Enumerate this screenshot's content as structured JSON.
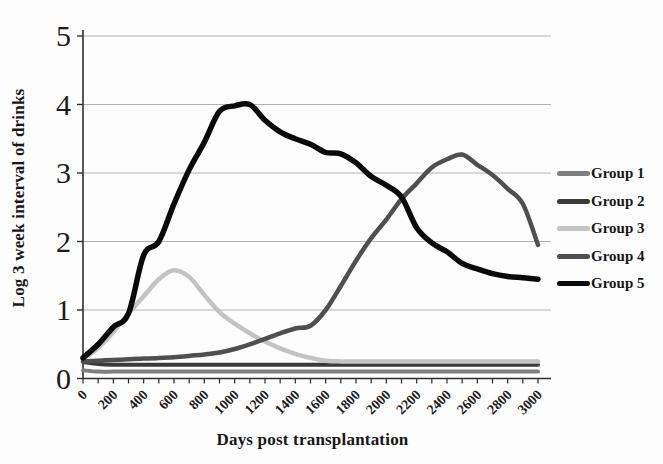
{
  "chart_data": {
    "type": "line",
    "title": "",
    "xlabel": "Days post transplantation",
    "ylabel": "Log 3 week interval of drinks",
    "xlim": [
      0,
      3000
    ],
    "ylim": [
      0,
      5
    ],
    "x_tick_step": 200,
    "x_minor_tick_step": 100,
    "x_tick_labels": [
      "0",
      "200",
      "400",
      "600",
      "800",
      "1000",
      "1200",
      "1400",
      "1600",
      "1800",
      "2000",
      "2200",
      "2400",
      "2600",
      "2800",
      "3000"
    ],
    "y_tick_labels": [
      "0",
      "1",
      "2",
      "3",
      "4",
      "5"
    ],
    "y_ticks": [
      0,
      1,
      2,
      3,
      4,
      5
    ],
    "grid": "horizontal",
    "legend_position": "right",
    "smoothed_lines": true,
    "colors": {
      "grid": "#b3b3b3",
      "axis": "#2e2e2e",
      "text": "#1b1b1b"
    },
    "x": [
      0,
      100,
      200,
      300,
      400,
      500,
      600,
      700,
      800,
      900,
      1000,
      1100,
      1200,
      1300,
      1400,
      1500,
      1600,
      1700,
      1800,
      1900,
      2000,
      2100,
      2200,
      2300,
      2400,
      2500,
      2600,
      2700,
      2800,
      2900,
      3000
    ],
    "series": [
      {
        "name": "Group 1",
        "color": "#7f7f7f",
        "width": 4,
        "values": [
          0.12,
          0.1,
          0.1,
          0.1,
          0.1,
          0.1,
          0.1,
          0.1,
          0.1,
          0.1,
          0.1,
          0.1,
          0.1,
          0.1,
          0.1,
          0.1,
          0.1,
          0.1,
          0.1,
          0.1,
          0.1,
          0.1,
          0.1,
          0.1,
          0.1,
          0.1,
          0.1,
          0.1,
          0.1,
          0.1,
          0.1
        ]
      },
      {
        "name": "Group 2",
        "color": "#3a3a3a",
        "width": 4,
        "values": [
          0.24,
          0.21,
          0.2,
          0.2,
          0.2,
          0.2,
          0.2,
          0.2,
          0.2,
          0.2,
          0.2,
          0.2,
          0.2,
          0.2,
          0.2,
          0.2,
          0.2,
          0.2,
          0.2,
          0.2,
          0.2,
          0.2,
          0.2,
          0.2,
          0.2,
          0.2,
          0.2,
          0.2,
          0.2,
          0.2,
          0.2
        ]
      },
      {
        "name": "Group 3",
        "color": "#c3c3c3",
        "width": 4.5,
        "values": [
          0.28,
          0.45,
          0.68,
          0.95,
          1.2,
          1.45,
          1.58,
          1.48,
          1.22,
          0.97,
          0.8,
          0.66,
          0.54,
          0.44,
          0.36,
          0.3,
          0.26,
          0.25,
          0.25,
          0.25,
          0.25,
          0.25,
          0.25,
          0.25,
          0.25,
          0.25,
          0.25,
          0.25,
          0.25,
          0.25,
          0.25
        ]
      },
      {
        "name": "Group 4",
        "color": "#4f4f4f",
        "width": 4.5,
        "values": [
          0.25,
          0.26,
          0.27,
          0.28,
          0.29,
          0.3,
          0.31,
          0.33,
          0.35,
          0.38,
          0.43,
          0.5,
          0.58,
          0.66,
          0.73,
          0.77,
          1.0,
          1.35,
          1.72,
          2.05,
          2.32,
          2.62,
          2.85,
          3.08,
          3.2,
          3.27,
          3.12,
          2.97,
          2.77,
          2.55,
          1.95
        ]
      },
      {
        "name": "Group 5",
        "color": "#0a0a0a",
        "width": 5.5,
        "values": [
          0.3,
          0.5,
          0.75,
          0.95,
          1.8,
          2.0,
          2.55,
          3.05,
          3.45,
          3.9,
          3.98,
          4.0,
          3.77,
          3.6,
          3.5,
          3.42,
          3.3,
          3.28,
          3.15,
          2.95,
          2.82,
          2.65,
          2.2,
          1.98,
          1.85,
          1.68,
          1.6,
          1.53,
          1.49,
          1.47,
          1.45
        ]
      }
    ]
  }
}
